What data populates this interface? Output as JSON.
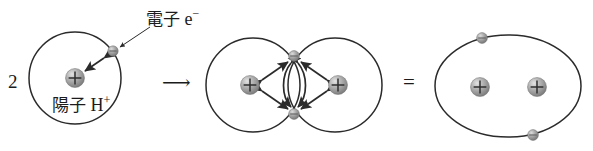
{
  "figure": {
    "background_color": "#ffffff",
    "stroke_color": "#2b2b2b",
    "proton_color": "#9a9a9a",
    "electron_color": "#9a9a9a",
    "width": 593,
    "height": 151
  },
  "equation": {
    "coefficient": "2",
    "arrow": "⟶",
    "equals": "="
  },
  "labels": {
    "electron_jp": "電子",
    "electron_symbol": "e",
    "electron_charge": "−",
    "proton_jp": "陽子",
    "proton_symbol": "H",
    "proton_charge": "+"
  },
  "panels": [
    {
      "name": "single-hydrogen-atom",
      "kind": "atom",
      "orbit": {
        "cx": 75,
        "cy": 78,
        "r": 46
      },
      "protons": [
        {
          "cx": 75,
          "cy": 78,
          "r": 9,
          "charge": "+"
        }
      ],
      "electrons": [
        {
          "cx": 113,
          "cy": 52,
          "r": 5
        }
      ],
      "force_arrows": [
        {
          "from": [
            104,
            60
          ],
          "to": [
            84,
            72
          ],
          "type": "double-headed-straight"
        }
      ]
    },
    {
      "name": "hydrogen-molecule-overlap",
      "kind": "molecule",
      "orbits": [
        {
          "cx": 253,
          "cy": 85,
          "r": 47
        },
        {
          "cx": 335,
          "cy": 85,
          "r": 47
        }
      ],
      "protons": [
        {
          "cx": 250,
          "cy": 85,
          "r": 9,
          "charge": "+"
        },
        {
          "cx": 338,
          "cy": 85,
          "r": 9,
          "charge": "+"
        }
      ],
      "electrons": [
        {
          "cx": 294,
          "cy": 56,
          "r": 5
        },
        {
          "cx": 294,
          "cy": 114,
          "r": 5
        }
      ],
      "force_arrows": [
        {
          "from": [
            250,
            85
          ],
          "to": [
            294,
            56
          ],
          "type": "double-headed-straight"
        },
        {
          "from": [
            250,
            85
          ],
          "to": [
            294,
            114
          ],
          "type": "double-headed-straight"
        },
        {
          "from": [
            338,
            85
          ],
          "to": [
            294,
            56
          ],
          "type": "double-headed-straight"
        },
        {
          "from": [
            338,
            85
          ],
          "to": [
            294,
            114
          ],
          "type": "double-headed-straight"
        },
        {
          "from": [
            294,
            56
          ],
          "to": [
            294,
            114
          ],
          "type": "double-headed-curved-left"
        },
        {
          "from": [
            294,
            56
          ],
          "to": [
            294,
            114
          ],
          "type": "double-headed-curved-right"
        }
      ]
    },
    {
      "name": "hydrogen-molecule-combined",
      "kind": "molecule-result",
      "orbit": {
        "cx": 508,
        "cy": 86,
        "r": 0,
        "rx": 73,
        "ry": 52
      },
      "protons": [
        {
          "cx": 480,
          "cy": 87,
          "r": 9,
          "charge": "+"
        },
        {
          "cx": 537,
          "cy": 87,
          "r": 9,
          "charge": "+"
        }
      ],
      "electrons": [
        {
          "cx": 482,
          "cy": 37,
          "r": 5
        },
        {
          "cx": 533,
          "cy": 135,
          "r": 5
        }
      ]
    }
  ],
  "leader_line": {
    "name": "electron-callout-leader",
    "from": [
      149,
      26
    ],
    "to": [
      118,
      48
    ]
  }
}
